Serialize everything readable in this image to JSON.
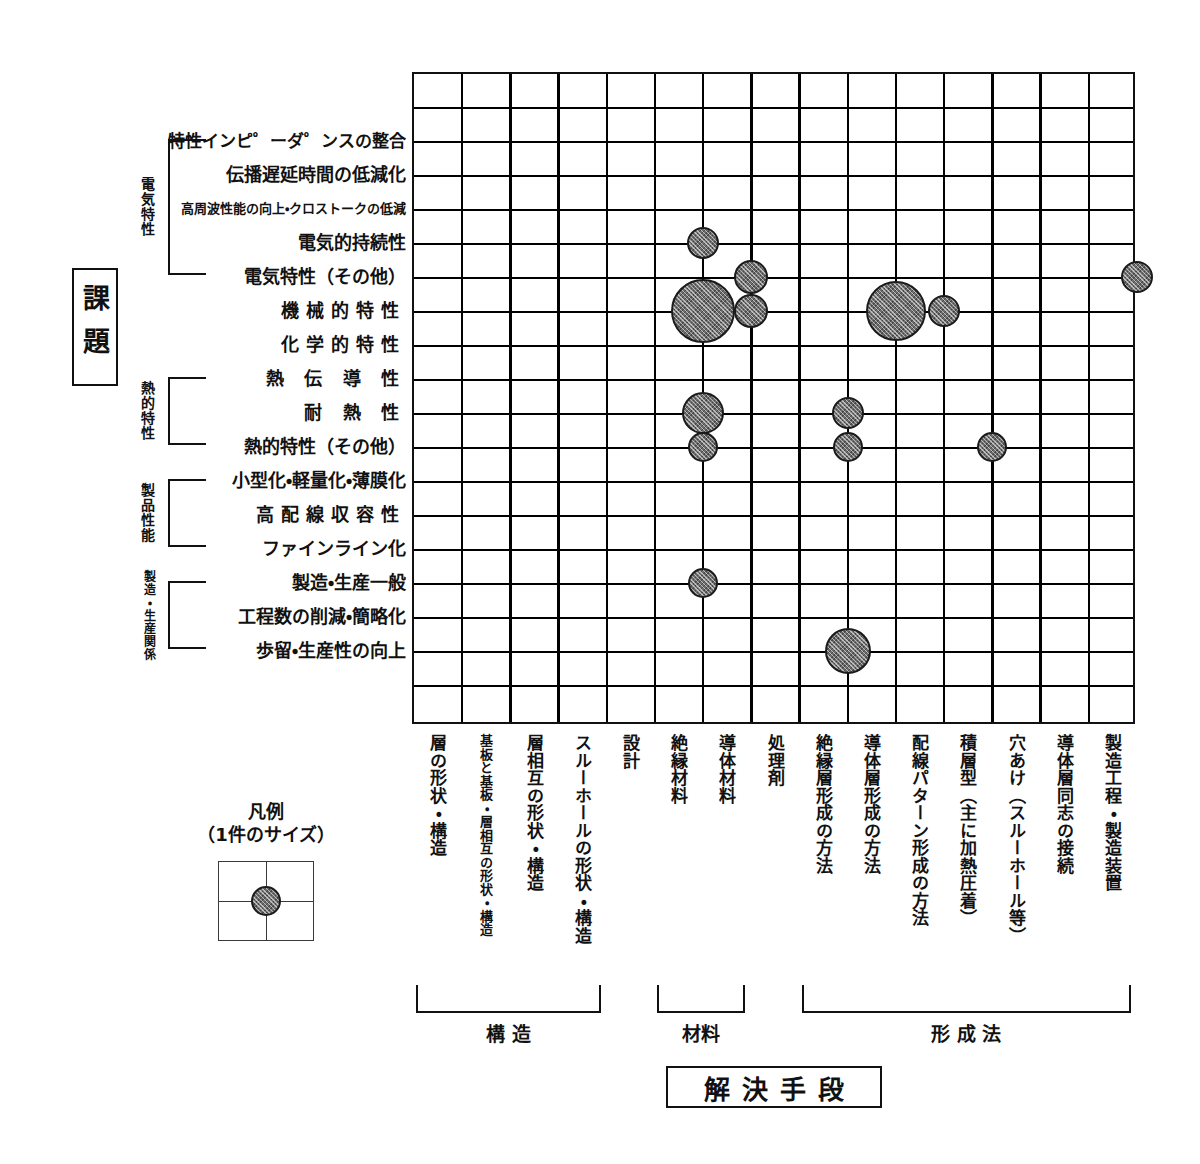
{
  "axis_titles": {
    "vertical": "課題",
    "horizontal": "解決手段"
  },
  "legend": {
    "title": "凡例",
    "subtitle": "（1件のサイズ）",
    "bubble_label": "1件"
  },
  "rows": [
    {
      "id": "r1",
      "label": "特性インピ゜ーダ゜ンスの整合",
      "size": "small"
    },
    {
      "id": "r2",
      "label": "伝播遅延時間の低減化",
      "size": "medium"
    },
    {
      "id": "r3",
      "label": "高周波性能の向上・クロストークの低減",
      "size": "tiny"
    },
    {
      "id": "r4",
      "label": "電気的持続性",
      "size": "medium"
    },
    {
      "id": "r5",
      "label": "電気特性（その他）",
      "size": "medium"
    },
    {
      "id": "r6",
      "label": "機械的特性",
      "size": "wide"
    },
    {
      "id": "r7",
      "label": "化学的特性",
      "size": "wide"
    },
    {
      "id": "r8",
      "label": "熱 伝 導 性",
      "size": "wide"
    },
    {
      "id": "r9",
      "label": "耐 熱 性",
      "size": "wide"
    },
    {
      "id": "r10",
      "label": "熱的特性（その他）",
      "size": "medium"
    },
    {
      "id": "r11",
      "label": "小型化・軽量化・薄膜化",
      "size": "medium"
    },
    {
      "id": "r12",
      "label": "高配線収容性",
      "size": "wide"
    },
    {
      "id": "r13",
      "label": "ファインライン化",
      "size": "medium"
    },
    {
      "id": "r14",
      "label": "製造・生産一般",
      "size": "medium"
    },
    {
      "id": "r15",
      "label": "工程数の削減・簡略化",
      "size": "medium"
    },
    {
      "id": "r16",
      "label": "歩留・生産性の向上",
      "size": "medium"
    }
  ],
  "row_groups": [
    {
      "name": "電気特性",
      "from": 1,
      "to": 5
    },
    {
      "name": "熱的特性",
      "from": 8,
      "to": 10
    },
    {
      "name": "製品性能",
      "from": 11,
      "to": 13
    },
    {
      "name": "製造・生産関係",
      "from": 14,
      "to": 16
    }
  ],
  "columns": [
    {
      "id": "c1",
      "label": "層の形状・構造",
      "size": "medium"
    },
    {
      "id": "c2",
      "label": "基板と基板・層相互の形状・構造",
      "size": "small"
    },
    {
      "id": "c3",
      "label": "層相互の形状・構造",
      "size": "medium"
    },
    {
      "id": "c4",
      "label": "スルーホールの形状・構造",
      "size": "medium"
    },
    {
      "id": "c5",
      "label": "設計",
      "size": "medium"
    },
    {
      "id": "c6",
      "label": "絶縁材料",
      "size": "medium"
    },
    {
      "id": "c7",
      "label": "導体材料",
      "size": "medium"
    },
    {
      "id": "c8",
      "label": "処理剤",
      "size": "medium"
    },
    {
      "id": "c9",
      "label": "絶縁層形成の方法",
      "size": "medium"
    },
    {
      "id": "c10",
      "label": "導体層形成の方法",
      "size": "medium"
    },
    {
      "id": "c11",
      "label": "配線パターン形成の方法",
      "size": "medium"
    },
    {
      "id": "c12",
      "label": "積層型（主に加熱圧着）",
      "size": "medium"
    },
    {
      "id": "c13",
      "label": "穴あけ（スルーホール等）",
      "size": "medium"
    },
    {
      "id": "c14",
      "label": "導体層同志の接続",
      "size": "medium"
    },
    {
      "id": "c15",
      "label": "製造工程・製造装置",
      "size": "medium"
    }
  ],
  "column_groups": [
    {
      "name": "構 造",
      "from": 1,
      "to": 4
    },
    {
      "name": "材料",
      "from": 6,
      "to": 7
    },
    {
      "name": "形 成 法",
      "from": 9,
      "to": 15
    }
  ],
  "chart_data": {
    "type": "scatter",
    "xlabel": "解決手段",
    "ylabel": "課題",
    "grid": true,
    "legend_position": "bottom-left",
    "x_categories": [
      "層の形状・構造",
      "基板と基板・層相互の形状・構造",
      "層相互の形状・構造",
      "スルーホールの形状・構造",
      "設計",
      "絶縁材料",
      "導体材料",
      "処理剤",
      "絶縁層形成の方法",
      "導体層形成の方法",
      "配線パターン形成の方法",
      "積層型（主に加熱圧着）",
      "穴あけ（スルーホール等）",
      "導体層同志の接続",
      "製造工程・製造装置"
    ],
    "y_categories": [
      "特性インピ゜ーダ゜ンスの整合",
      "伝播遅延時間の低減化",
      "高周波性能の向上・クロストークの低減",
      "電気的持続性",
      "電気特性（その他）",
      "機械的特性",
      "化学的特性",
      "熱 伝 導 性",
      "耐 熱 性",
      "熱的特性（その他）",
      "小型化・軽量化・薄膜化",
      "高配線収容性",
      "ファインライン化",
      "製造・生産一般",
      "工程数の削減・簡略化",
      "歩留・生産性の向上"
    ],
    "bubble_color": "#6e6e6e",
    "bubble_outline": "#1b1b1b",
    "points": [
      {
        "x": "絶縁材料",
        "y": "電気的持続性",
        "col": 6,
        "row": 4,
        "r": 16
      },
      {
        "x": "導体材料",
        "y": "電気特性（その他）",
        "col": 7,
        "row": 5,
        "r": 17
      },
      {
        "x": "製造工程・製造装置",
        "y": "電気特性（その他）",
        "col": 15,
        "row": 5,
        "r": 16
      },
      {
        "x": "絶縁材料",
        "y": "機械的特性",
        "col": 6,
        "row": 6,
        "r": 32
      },
      {
        "x": "導体材料",
        "y": "機械的特性",
        "col": 7,
        "row": 6,
        "r": 17
      },
      {
        "x": "導体層形成の方法",
        "y": "機械的特性",
        "col": 10,
        "row": 6,
        "r": 30
      },
      {
        "x": "配線パターン形成の方法",
        "y": "機械的特性",
        "col": 11,
        "row": 6,
        "r": 16
      },
      {
        "x": "絶縁材料",
        "y": "耐 熱 性",
        "col": 6,
        "row": 9,
        "r": 21
      },
      {
        "x": "絶縁層形成の方法",
        "y": "耐 熱 性",
        "col": 9,
        "row": 9,
        "r": 16
      },
      {
        "x": "絶縁材料",
        "y": "熱的特性（その他）",
        "col": 6,
        "row": 10,
        "r": 15
      },
      {
        "x": "絶縁層形成の方法",
        "y": "熱的特性（その他）",
        "col": 9,
        "row": 10,
        "r": 15
      },
      {
        "x": "積層型（主に加熱圧着）",
        "y": "熱的特性（その他）",
        "col": 12,
        "row": 10,
        "r": 15
      },
      {
        "x": "絶縁材料",
        "y": "製造・生産一般",
        "col": 6,
        "row": 14,
        "r": 15
      },
      {
        "x": "絶縁層形成の方法",
        "y": "歩留・生産性の向上",
        "col": 9,
        "row": 16,
        "r": 23
      }
    ]
  }
}
